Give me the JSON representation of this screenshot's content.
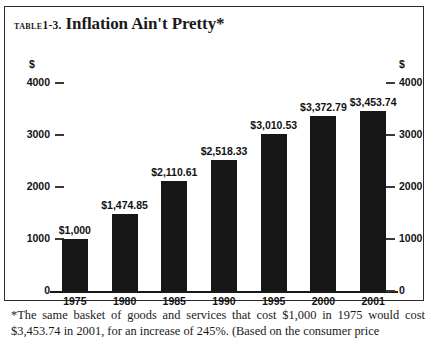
{
  "title": {
    "table_label": "TABLE",
    "table_number": "1-3.",
    "heading": "Inflation Ain't Pretty*"
  },
  "axes": {
    "currency_symbol": "$",
    "y_ticks": [
      "4000",
      "3000",
      "2000",
      "1000",
      "0"
    ],
    "y_min": 0,
    "y_max": 4000
  },
  "footnote": "*The same basket of goods and services that cost $1,000 in 1975 would cost $3,453.74 in 2001, for an increase of 245%. (Based on the consumer price",
  "colors": {
    "bar": "#171717",
    "text": "#111111",
    "frame": "#2b2b2b"
  },
  "chart_data": {
    "type": "bar",
    "title": "Inflation Ain't Pretty*",
    "xlabel": "",
    "ylabel": "$",
    "ylim": [
      0,
      4000
    ],
    "grid": false,
    "legend": false,
    "categories": [
      "1975",
      "1980",
      "1985",
      "1990",
      "1995",
      "2000",
      "2001"
    ],
    "values": [
      1000,
      1474.85,
      2110.61,
      2518.33,
      3010.53,
      3372.79,
      3453.74
    ],
    "data_labels": [
      "$1,000",
      "$1,474.85",
      "$2,110.61",
      "$2,518.33",
      "$3,010.53",
      "$3,372.79",
      "$3,453.74"
    ],
    "annotation": "*The same basket of goods and services that cost $1,000 in 1975 would cost $3,453.74 in 2001, for an increase of 245%. (Based on the consumer price"
  }
}
